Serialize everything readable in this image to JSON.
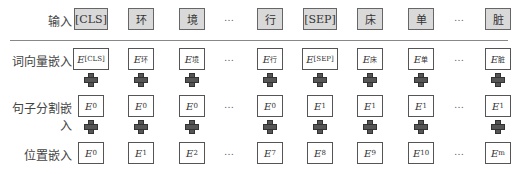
{
  "rows": {
    "input": {
      "label": "输入",
      "tokens": [
        "[CLS]",
        "环",
        "境",
        "…",
        "行",
        "[SEP]",
        "床",
        "单",
        "…",
        "脏"
      ]
    },
    "token_embedding": {
      "label": "词向量嵌入",
      "base": "E",
      "subs": [
        "[CLS]",
        "环",
        "境",
        "…",
        "行",
        "[SEP]",
        "床",
        "单",
        "…",
        "脏"
      ]
    },
    "segment_embedding": {
      "label": "句子分割嵌入",
      "base": "E",
      "subs": [
        "0",
        "0",
        "0",
        "…",
        "0",
        "1",
        "1",
        "1",
        "…",
        "1"
      ]
    },
    "position_embedding": {
      "label": "位置嵌入",
      "base": "E",
      "subs": [
        "0",
        "1",
        "2",
        "…",
        "7",
        "8",
        "9",
        "10",
        "…",
        "m"
      ]
    }
  },
  "icons": {
    "plus": "plus-icon"
  },
  "colors": {
    "input_fill": "#d9d9d9",
    "border": "#555555",
    "plus": "#555555"
  }
}
